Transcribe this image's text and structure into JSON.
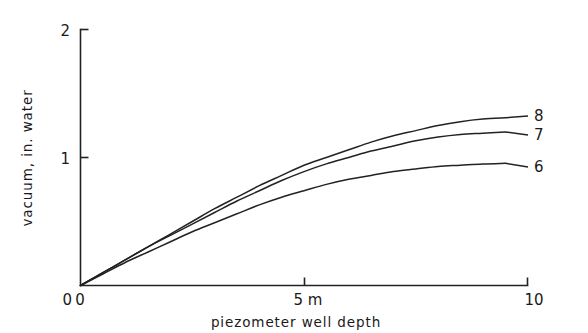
{
  "chart_data": {
    "type": "line",
    "title": "",
    "xlabel": "piezometer well depth",
    "ylabel": "vacuum, in. water",
    "xlim": [
      0,
      10
    ],
    "ylim": [
      0,
      2
    ],
    "grid": false,
    "legend_position": "right-end-labels",
    "x_tick_labels": [
      "0",
      "5 m",
      "10"
    ],
    "x_tick_values": [
      0,
      5,
      10
    ],
    "y_tick_labels": [
      "0",
      "1",
      "2"
    ],
    "y_tick_values": [
      0,
      1,
      2
    ],
    "x_unit": "m",
    "y_unit": "in. water",
    "x": [
      0,
      0.5,
      1,
      1.5,
      2,
      2.5,
      3,
      3.5,
      4,
      4.5,
      5,
      5.5,
      6,
      6.5,
      7,
      7.5,
      8,
      8.5,
      9,
      9.5
    ],
    "series": [
      {
        "name": "8",
        "label": "8",
        "color": "#222222",
        "values": [
          0,
          0.1,
          0.2,
          0.3,
          0.4,
          0.5,
          0.6,
          0.69,
          0.78,
          0.86,
          0.94,
          1.0,
          1.06,
          1.12,
          1.17,
          1.21,
          1.25,
          1.28,
          1.3,
          1.31
        ]
      },
      {
        "name": "7",
        "label": "7",
        "color": "#222222",
        "values": [
          0,
          0.1,
          0.2,
          0.3,
          0.39,
          0.48,
          0.57,
          0.66,
          0.74,
          0.82,
          0.89,
          0.95,
          1.0,
          1.05,
          1.09,
          1.13,
          1.16,
          1.18,
          1.19,
          1.2
        ]
      },
      {
        "name": "6",
        "label": "6",
        "color": "#222222",
        "values": [
          0,
          0.09,
          0.18,
          0.26,
          0.34,
          0.42,
          0.49,
          0.56,
          0.63,
          0.69,
          0.74,
          0.79,
          0.83,
          0.86,
          0.89,
          0.91,
          0.93,
          0.94,
          0.95,
          0.955
        ]
      }
    ]
  },
  "axes": {
    "y_label": "vacuum, in. water",
    "x_label": "piezometer well depth",
    "y_ticks": [
      {
        "label": "2",
        "value": 2
      },
      {
        "label": "1",
        "value": 1
      },
      {
        "label": "0",
        "value": 0
      }
    ],
    "x_ticks": [
      {
        "label": "0",
        "value": 0
      },
      {
        "label": "5 m",
        "value": 5
      },
      {
        "label": "10",
        "value": 10
      }
    ]
  },
  "series_labels": [
    {
      "text": "8",
      "value": 8
    },
    {
      "text": "7",
      "value": 7
    },
    {
      "text": "6",
      "value": 6
    }
  ],
  "colors": {
    "ink": "#222222",
    "background": "#ffffff"
  }
}
